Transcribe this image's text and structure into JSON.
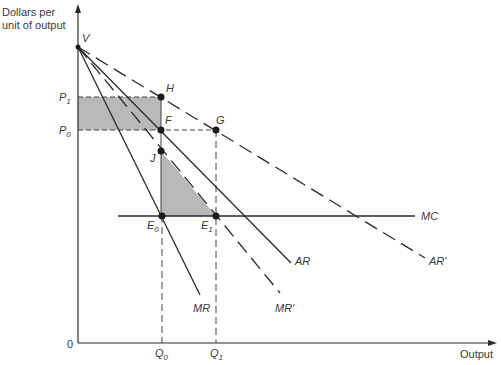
{
  "diagram": {
    "type": "economics-monopoly-diagram",
    "y_axis_label_line1": "Dollars per",
    "y_axis_label_line2": "unit of output",
    "x_axis_label": "Output",
    "origin_label": "0",
    "price_labels": {
      "p1": {
        "base": "P",
        "sub": "1"
      },
      "p0": {
        "base": "P",
        "sub": "0"
      }
    },
    "quantity_labels": {
      "q0": {
        "base": "Q",
        "sub": "0"
      },
      "q1": {
        "base": "Q",
        "sub": "1"
      }
    },
    "points": {
      "V": "V",
      "H": "H",
      "F": "F",
      "G": "G",
      "J": "J",
      "E0": {
        "base": "E",
        "sub": "0"
      },
      "E1": {
        "base": "E",
        "sub": "1"
      }
    },
    "curves": {
      "MC": "MC",
      "AR": "AR",
      "AR_prime": "AR'",
      "MR": "MR",
      "MR_prime": "MR'"
    },
    "colors": {
      "line": "#2a2a2a",
      "shade": "#b8b8b8",
      "text": "#3a3a3a"
    }
  }
}
